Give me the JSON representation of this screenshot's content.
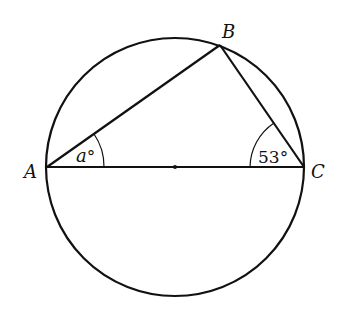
{
  "diagram": {
    "type": "geometry",
    "circle": {
      "cx": 175,
      "cy": 167,
      "r": 129
    },
    "center_point": {
      "x": 175,
      "y": 167
    },
    "points": [
      {
        "name": "A",
        "x": 47,
        "y": 167,
        "label": "A"
      },
      {
        "name": "B",
        "x": 220,
        "y": 45,
        "label": "B"
      },
      {
        "name": "C",
        "x": 304,
        "y": 167,
        "label": "C"
      }
    ],
    "angles": [
      {
        "vertex": "A",
        "label": "a°",
        "label_var": "a",
        "label_unit": "°"
      },
      {
        "vertex": "C",
        "label": "53°"
      }
    ],
    "stroke_color": "#111111",
    "background": "#ffffff"
  }
}
